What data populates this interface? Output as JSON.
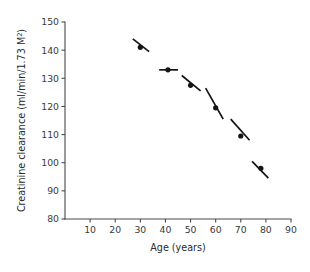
{
  "chart_data": {
    "type": "scatter",
    "title": "",
    "xlabel": "Age (years)",
    "ylabel": "Creatinine clearance (ml/min/1.73 M²)",
    "ylabel_parts": {
      "main": "Creatinine clearance (ml/min/1.73 M",
      "superscript": "2",
      "tail": ")"
    },
    "xlim": [
      0,
      90
    ],
    "ylim": [
      80,
      150
    ],
    "grid": false,
    "legend": null,
    "x_ticks": [
      10,
      20,
      30,
      40,
      50,
      60,
      70,
      80,
      90
    ],
    "x_tick_labels": [
      "10",
      "20",
      "30",
      "40",
      "50",
      "60",
      "70",
      "80",
      "90"
    ],
    "y_ticks": [
      80,
      90,
      100,
      110,
      120,
      130,
      140,
      150
    ],
    "y_tick_labels": [
      "80",
      "90",
      "100",
      "110",
      "120",
      "130",
      "140",
      "150"
    ],
    "points": [
      {
        "x": 30,
        "y": 141.0,
        "slope_segment": {
          "x1": 27.0,
          "y1": 144.0,
          "x2": 33.5,
          "y2": 139.5
        }
      },
      {
        "x": 41,
        "y": 133.0,
        "slope_segment": {
          "x1": 37.5,
          "y1": 133.0,
          "x2": 45.0,
          "y2": 133.0
        }
      },
      {
        "x": 50,
        "y": 127.5,
        "slope_segment": {
          "x1": 46.5,
          "y1": 131.0,
          "x2": 54.0,
          "y2": 125.5
        }
      },
      {
        "x": 60,
        "y": 119.5,
        "slope_segment": {
          "x1": 56.0,
          "y1": 126.5,
          "x2": 63.0,
          "y2": 115.5
        }
      },
      {
        "x": 70,
        "y": 109.5,
        "slope_segment": {
          "x1": 66.0,
          "y1": 115.5,
          "x2": 73.5,
          "y2": 108.0
        }
      },
      {
        "x": 78,
        "y": 98.0,
        "slope_segment": {
          "x1": 74.5,
          "y1": 100.5,
          "x2": 81.0,
          "y2": 94.5
        }
      }
    ],
    "series": [
      {
        "name": "Creatinine clearance vs age",
        "x": [
          30,
          41,
          50,
          60,
          70,
          78
        ],
        "values": [
          141.0,
          133.0,
          127.5,
          119.5,
          109.5,
          98.0
        ]
      }
    ],
    "colors": {
      "marker": "#141414",
      "slope_line": "#141414",
      "axis": "#4a4a4a",
      "text": "#2b2b2b",
      "background": "#ffffff"
    }
  }
}
